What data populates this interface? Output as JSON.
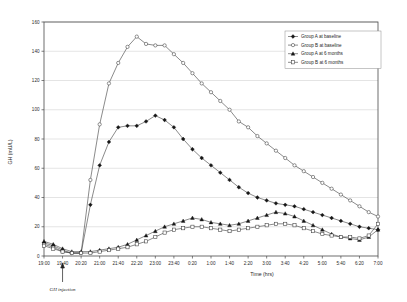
{
  "chart_data": {
    "type": "line",
    "title": "",
    "xlabel": "Time (hrs)",
    "ylabel": "GH (mU/L)",
    "ylim": [
      0,
      160
    ],
    "ytick_step": 20,
    "yticks": [
      0,
      20,
      40,
      60,
      80,
      100,
      120,
      140,
      160
    ],
    "grid": "horizontal",
    "legend_position": "top-right",
    "x": [
      "19:00",
      "19:20",
      "19:40",
      "20:00",
      "20:20",
      "20:40",
      "21:00",
      "21:20",
      "21:40",
      "22:00",
      "22:20",
      "22:40",
      "23:00",
      "23:20",
      "23:40",
      "0:00",
      "0:20",
      "0:40",
      "1:00",
      "1:20",
      "1:40",
      "2:00",
      "2:20",
      "2:40",
      "3:00",
      "3:20",
      "3:40",
      "4:00",
      "4:20",
      "4:40",
      "5:00",
      "5:20",
      "5:40",
      "6:00",
      "6:20",
      "6:40",
      "7:00"
    ],
    "xticks": [
      "19:00",
      "19:40",
      "20:20",
      "21:00",
      "21:40",
      "22:20",
      "23:00",
      "23:40",
      "0:20",
      "1:00",
      "1:40",
      "2:20",
      "3:00",
      "3:40",
      "4:20",
      "5:00",
      "5:40",
      "6:20",
      "7:00"
    ],
    "annotations": [
      {
        "label": "GH injection",
        "x": "19:40",
        "kind": "up-arrow-below-axis"
      }
    ],
    "series": [
      {
        "name": "Group A at baseline",
        "marker": "filled-diamond",
        "values": [
          9,
          7,
          4,
          2,
          2,
          35,
          62,
          78,
          88,
          89,
          89,
          92,
          96,
          93,
          88,
          80,
          73,
          67,
          62,
          57,
          52,
          47,
          43,
          40,
          38,
          36,
          35,
          34,
          32,
          30,
          28,
          26,
          24,
          22,
          20,
          19,
          18
        ]
      },
      {
        "name": "Group B at baseline",
        "marker": "open-circle",
        "values": [
          8,
          6,
          3,
          2,
          2,
          52,
          90,
          118,
          132,
          143,
          150,
          145,
          144,
          144,
          138,
          132,
          125,
          118,
          112,
          106,
          100,
          92,
          88,
          82,
          77,
          72,
          67,
          62,
          58,
          54,
          50,
          46,
          42,
          38,
          34,
          30,
          27
        ]
      },
      {
        "name": "Group A at 6 months",
        "marker": "filled-triangle",
        "values": [
          10,
          8,
          5,
          3,
          3,
          3,
          4,
          5,
          6,
          8,
          11,
          14,
          17,
          20,
          22,
          24,
          26,
          25,
          23,
          22,
          21,
          22,
          24,
          26,
          28,
          30,
          29,
          27,
          24,
          21,
          18,
          15,
          13,
          12,
          11,
          13,
          18
        ]
      },
      {
        "name": "Group B at 6 months",
        "marker": "open-square",
        "values": [
          7,
          5,
          3,
          2,
          2,
          2,
          3,
          4,
          5,
          6,
          8,
          10,
          13,
          16,
          18,
          19,
          20,
          20,
          19,
          18,
          17,
          18,
          19,
          20,
          21,
          22,
          22,
          21,
          19,
          17,
          15,
          14,
          13,
          13,
          12,
          14,
          22
        ]
      }
    ]
  },
  "legend": {
    "items": [
      {
        "label": "Group A at baseline"
      },
      {
        "label": "Group B at baseline"
      },
      {
        "label": "Group A at 6 months"
      },
      {
        "label": "Group B at 6 months"
      }
    ]
  }
}
